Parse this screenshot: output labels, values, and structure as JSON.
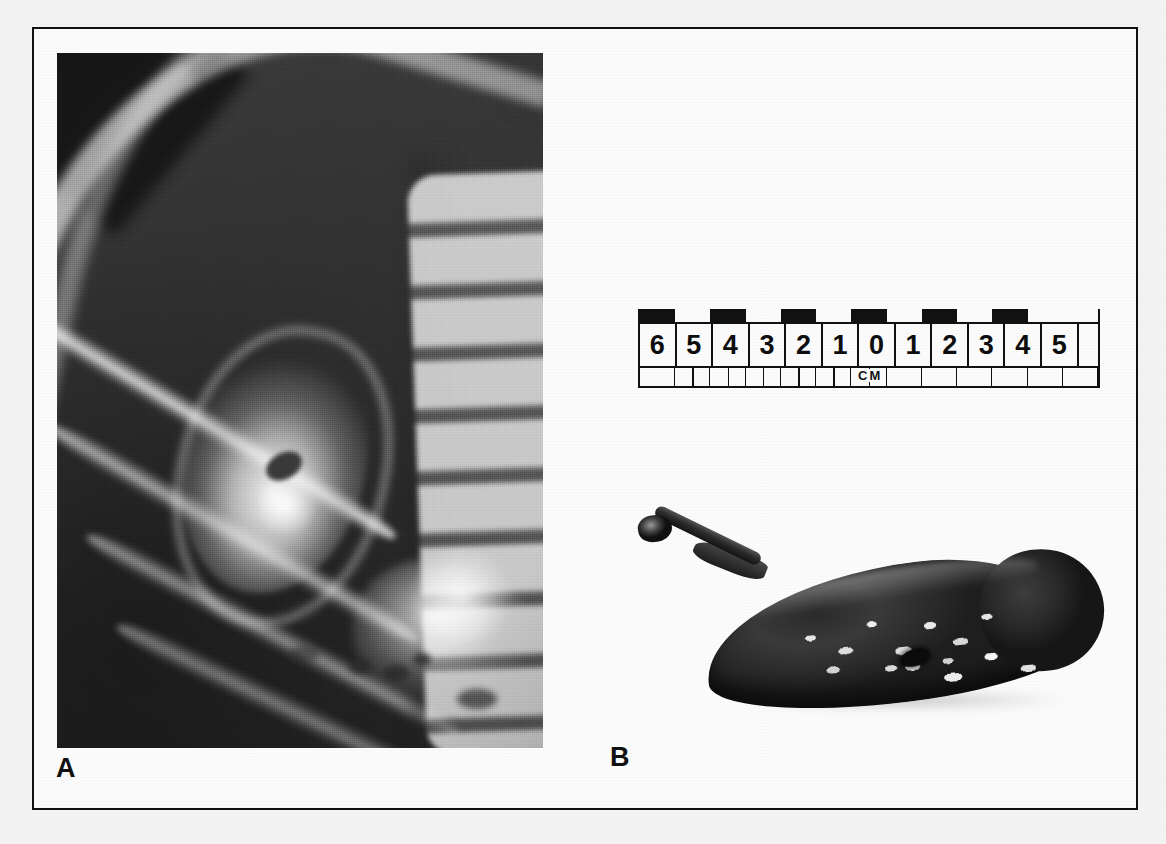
{
  "figure": {
    "panels": [
      {
        "id": "A",
        "letter": "A",
        "kind": "radiograph",
        "description": "Plain abdominal radiograph, right upper quadrant, demonstrating a calcified (porcelain) gallbladder projected over the lower ribs and lumbar vertebral bodies, with a central lucent calculus and bowel gas inferiorly."
      },
      {
        "id": "B",
        "letter": "B",
        "kind": "gross-specimen-photograph",
        "description": "Resected gallbladder specimen, pear shaped with attached cystic duct and surgical clip, mucosal surface showing patchy pale calcific plaques, photographed beside a centimetre scale."
      }
    ]
  },
  "ruler": {
    "unit_label": "CM",
    "left_labels": [
      "6",
      "5",
      "4",
      "3",
      "2",
      "1"
    ],
    "zero_label": "0",
    "right_labels": [
      "1",
      "2",
      "3",
      "4",
      "5"
    ],
    "all_labels": [
      "6",
      "5",
      "4",
      "3",
      "2",
      "1",
      "0",
      "1",
      "2",
      "3",
      "4",
      "5",
      ""
    ],
    "total_cells": 13,
    "strip_pattern": [
      "black",
      "white",
      "black",
      "white",
      "black",
      "white",
      "black",
      "white",
      "black",
      "white",
      "black",
      "white",
      "white"
    ],
    "subdivision": "half-centimetre ticks on the left half only",
    "sub_pattern": [
      "plain",
      "half",
      "half",
      "half",
      "half",
      "half",
      "half",
      "plain",
      "plain",
      "plain",
      "plain",
      "plain",
      "plain"
    ]
  },
  "colors": {
    "ink": "#111111",
    "paper": "#fbfbfb",
    "page": "#f3f3f3",
    "frame": "#111111"
  }
}
